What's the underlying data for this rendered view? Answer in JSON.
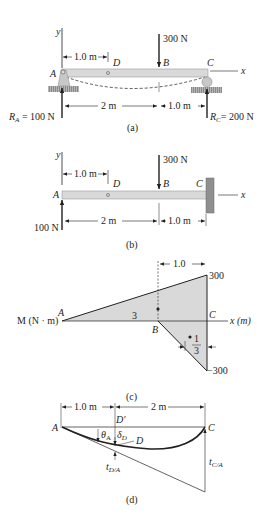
{
  "figure_a": {
    "caption": "(a)",
    "axis_y": "y",
    "axis_x": "x",
    "point_A": "A",
    "point_B": "B",
    "point_C": "C",
    "point_D": "D",
    "load": "300 N",
    "dim_AD": "1.0 m",
    "dim_AB": "2 m",
    "dim_BC": "1.0 m",
    "reaction_A_prefix": "R",
    "reaction_A_sub": "A",
    "reaction_A_value": " = 100 N",
    "reaction_C_prefix": "R",
    "reaction_C_sub": "C",
    "reaction_C_value": "= 200 N"
  },
  "figure_b": {
    "caption": "(b)",
    "axis_y": "y",
    "axis_x": "x",
    "point_A": "A",
    "point_B": "B",
    "point_C": "C",
    "point_D": "D",
    "load": "300 N",
    "dim_AD": "1.0 m",
    "dim_AB": "2 m",
    "dim_BC": "1.0 m",
    "reaction_A": "100 N"
  },
  "figure_c": {
    "caption": "(c)",
    "axis_label": "M (N · m)",
    "x_label": "x (m)",
    "point_A": "A",
    "point_B": "B",
    "point_C": "C",
    "top_value": "300",
    "bottom_value": "−300",
    "dim_top": "1.0",
    "label_3": "3",
    "frac_num": "1",
    "frac_den": "3"
  },
  "figure_d": {
    "caption": "(d)",
    "point_A": "A",
    "point_C": "C",
    "point_D": "D",
    "point_Dprime": "D′",
    "dim_AD": "1.0 m",
    "dim_DC": "2 m",
    "theta": "θ",
    "theta_sub": "A",
    "delta": "δ",
    "delta_sub": "D",
    "t_DA": "t",
    "t_DA_sub": "D/A",
    "t_CA": "t",
    "t_CA_sub": "C/A"
  }
}
